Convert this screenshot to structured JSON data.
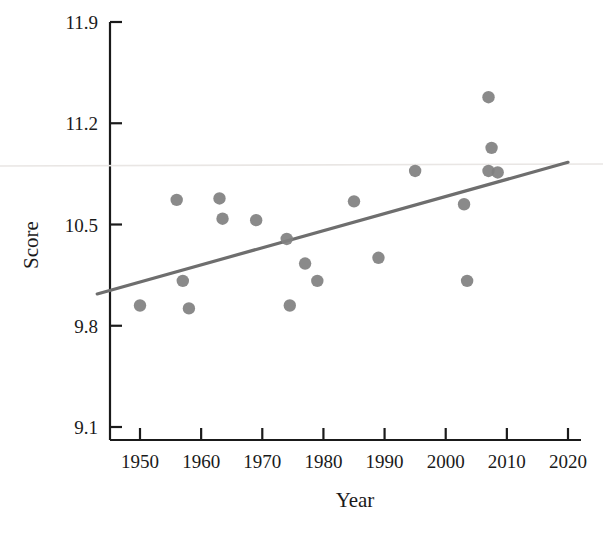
{
  "chart_data": {
    "type": "scatter",
    "title": "",
    "xlabel": "Year",
    "ylabel": "Score",
    "xlim": [
      1943,
      2020
    ],
    "ylim": [
      9.1,
      11.9
    ],
    "xticks": [
      1950,
      1960,
      1970,
      1980,
      1990,
      2000,
      2010,
      2020
    ],
    "xtick_labels": [
      "1950",
      "1960",
      "1970",
      "1980",
      "1990",
      "2000",
      "2010",
      "2020"
    ],
    "yticks": [
      9.1,
      9.8,
      10.5,
      11.2,
      11.9
    ],
    "ytick_labels": [
      "9.1",
      "9.8",
      "10.5",
      "11.2",
      "11.9"
    ],
    "grid": false,
    "legend": null,
    "marker_color": "#808080",
    "line_color": "#6e6e6e",
    "axis_color": "#1a1a1a",
    "points": [
      {
        "x": 1950,
        "y": 9.94
      },
      {
        "x": 1956,
        "y": 10.67
      },
      {
        "x": 1957,
        "y": 10.11
      },
      {
        "x": 1958,
        "y": 9.92
      },
      {
        "x": 1963,
        "y": 10.68
      },
      {
        "x": 1963.5,
        "y": 10.54
      },
      {
        "x": 1969,
        "y": 10.53
      },
      {
        "x": 1974,
        "y": 10.4
      },
      {
        "x": 1974.5,
        "y": 9.94
      },
      {
        "x": 1977,
        "y": 10.23
      },
      {
        "x": 1979,
        "y": 10.11
      },
      {
        "x": 1985,
        "y": 10.66
      },
      {
        "x": 1989,
        "y": 10.27
      },
      {
        "x": 1995,
        "y": 10.87
      },
      {
        "x": 2003,
        "y": 10.64
      },
      {
        "x": 2003.5,
        "y": 10.11
      },
      {
        "x": 2007,
        "y": 11.38
      },
      {
        "x": 2007.5,
        "y": 11.03
      },
      {
        "x": 2007,
        "y": 10.87
      },
      {
        "x": 2008.5,
        "y": 10.86
      }
    ],
    "trendline": {
      "x_start": 1943,
      "y_start": 10.02,
      "x_end": 2020,
      "y_end": 10.93
    }
  },
  "axes": {
    "x_axis_name": "Year",
    "y_axis_name": "Score"
  }
}
